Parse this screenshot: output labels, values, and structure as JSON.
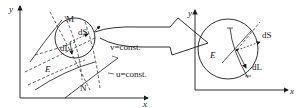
{
  "left_panel": {
    "axis_y": "y",
    "axis_x": "x",
    "point_M": "M",
    "point_N": "N",
    "field_E": "E",
    "vec_dS": "dS",
    "vec_dL": "dL",
    "curve_v": "v=const.",
    "curve_u": "u=const."
  },
  "right_panel": {
    "axis_y": "y",
    "axis_x": "x",
    "field_E": "E",
    "vec_dS": "dS",
    "vec_dL": "dL"
  },
  "colors": {
    "ink": "#1a1a1a",
    "background": "#ffffff"
  }
}
